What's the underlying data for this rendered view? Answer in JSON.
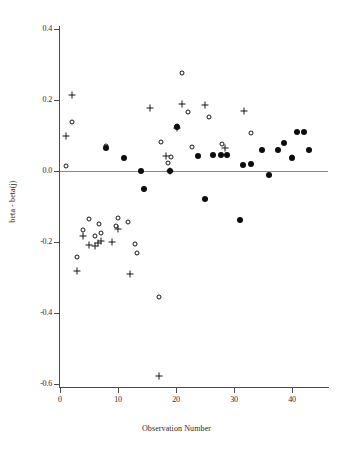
{
  "chart_data": {
    "type": "scatter",
    "title": "",
    "xlabel": "Observation Number",
    "ylabel": "beta - beta(j)",
    "xlim": [
      0,
      46.2
    ],
    "ylim": [
      -0.6,
      0.4
    ],
    "grid": false,
    "legend": "none",
    "xticks": [
      0,
      10,
      20,
      30,
      40
    ],
    "xticklabels": [
      "0",
      "10",
      "20",
      "30",
      "40"
    ],
    "yticks": [
      0.4,
      0.2,
      0.0,
      -0.2,
      -0.4,
      -0.6
    ],
    "yticklabels": [
      "0.4",
      "0.2",
      "0.0",
      "-0.2",
      "-0.4",
      "-0.6"
    ],
    "reference_line_y": 0.0,
    "series": [
      {
        "name": "plus",
        "marker": "plus",
        "points": [
          [
            2,
            0.215
          ],
          [
            1,
            0.1
          ],
          [
            3,
            -0.283
          ],
          [
            4,
            -0.182
          ],
          [
            5,
            -0.208
          ],
          [
            6,
            -0.21
          ],
          [
            6.6,
            -0.202
          ],
          [
            7,
            -0.196
          ],
          [
            9,
            -0.2
          ],
          [
            10,
            -0.162
          ],
          [
            12,
            -0.29
          ],
          [
            15.6,
            0.177
          ],
          [
            18.2,
            0.042
          ],
          [
            19,
            0.0
          ],
          [
            21,
            0.19
          ],
          [
            25,
            0.185
          ],
          [
            28.4,
            0.065
          ],
          [
            31.8,
            0.168
          ],
          [
            17,
            -0.578
          ],
          [
            20.2,
            0.122
          ]
        ]
      },
      {
        "name": "open-circle",
        "marker": "open",
        "points": [
          [
            1,
            0.013
          ],
          [
            2,
            0.138
          ],
          [
            5,
            -0.134
          ],
          [
            4,
            -0.166
          ],
          [
            6,
            -0.183
          ],
          [
            7,
            -0.176
          ],
          [
            6.8,
            -0.15
          ],
          [
            9.6,
            -0.155
          ],
          [
            10,
            -0.133
          ],
          [
            11.8,
            -0.144
          ],
          [
            13,
            -0.205
          ],
          [
            13.2,
            -0.232
          ],
          [
            3,
            -0.243
          ],
          [
            17,
            -0.355
          ],
          [
            17.4,
            0.082
          ],
          [
            18.6,
            0.022
          ],
          [
            19.2,
            0.04
          ],
          [
            20.2,
            0.128
          ],
          [
            21,
            0.277
          ],
          [
            22,
            0.167
          ],
          [
            22.8,
            0.068
          ],
          [
            25.6,
            0.152
          ],
          [
            28,
            0.075
          ],
          [
            33,
            0.106
          ],
          [
            40,
            0.04
          ],
          [
            31,
            -0.137
          ],
          [
            8,
            0.07
          ]
        ]
      },
      {
        "name": "filled-circle",
        "marker": "filled",
        "points": [
          [
            8,
            0.065
          ],
          [
            11,
            0.037
          ],
          [
            14,
            0.0
          ],
          [
            14.4,
            -0.052
          ],
          [
            19,
            0.0
          ],
          [
            20.2,
            0.125
          ],
          [
            23.8,
            0.043
          ],
          [
            25,
            -0.078
          ],
          [
            26.4,
            0.045
          ],
          [
            27.8,
            0.046
          ],
          [
            28.8,
            0.046
          ],
          [
            31,
            -0.137
          ],
          [
            31.6,
            0.018
          ],
          [
            33,
            0.021
          ],
          [
            34.8,
            0.06
          ],
          [
            36,
            -0.011
          ],
          [
            37.6,
            0.06
          ],
          [
            38.6,
            0.078
          ],
          [
            40,
            0.038
          ],
          [
            40.8,
            0.11
          ],
          [
            42,
            0.11
          ],
          [
            43,
            0.06
          ]
        ]
      }
    ]
  }
}
